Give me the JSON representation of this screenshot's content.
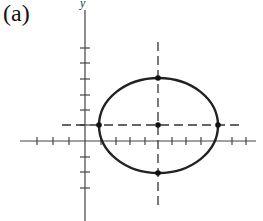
{
  "figure": {
    "label": "(a)",
    "y_axis_label": "y"
  },
  "axes": {
    "origin_px": [
      85,
      141
    ],
    "unit_px": 15,
    "x_ticks": [
      -4,
      -3,
      -2,
      -1,
      1,
      2,
      3,
      4,
      5,
      6,
      7,
      8,
      9,
      10,
      11
    ],
    "y_ticks": [
      -4,
      -3,
      -2,
      -1,
      1,
      2,
      3,
      4,
      5,
      6
    ]
  },
  "ellipse": {
    "center": [
      5,
      1
    ],
    "semi_major_x": 4,
    "semi_minor_y": 3,
    "marked_points": [
      [
        1,
        1
      ],
      [
        9,
        1
      ],
      [
        5,
        4
      ],
      [
        5,
        -2
      ],
      [
        5,
        1
      ]
    ]
  },
  "colors": {
    "stroke": "#222222",
    "axis": "#444444"
  }
}
